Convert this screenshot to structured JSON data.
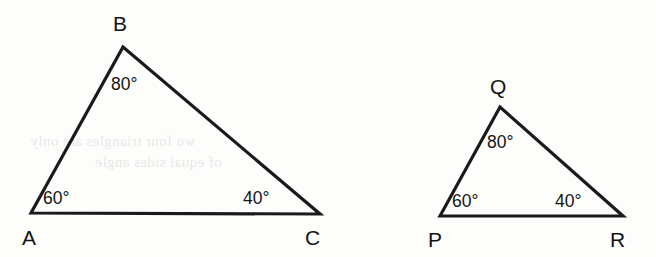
{
  "figure": {
    "background_color": "#fdfdfc",
    "stroke_color": "#1a1a1a",
    "triangles": [
      {
        "id": "triangle-abc",
        "name": "Triangle ABC",
        "vertices": [
          {
            "label": "A",
            "x": 31,
            "y": 213,
            "label_x": 22,
            "label_y": 245
          },
          {
            "label": "B",
            "x": 123,
            "y": 47,
            "label_x": 113,
            "label_y": 31
          },
          {
            "label": "C",
            "x": 320,
            "y": 214,
            "label_x": 305,
            "label_y": 245
          }
        ],
        "angles": [
          {
            "at": "A",
            "value": "60°",
            "x": 43,
            "y": 204
          },
          {
            "at": "B",
            "value": "80°",
            "x": 111,
            "y": 90
          },
          {
            "at": "C",
            "value": "40°",
            "x": 243,
            "y": 204
          }
        ]
      },
      {
        "id": "triangle-pqr",
        "name": "Triangle PQR",
        "vertices": [
          {
            "label": "P",
            "x": 440,
            "y": 216,
            "label_x": 428,
            "label_y": 247
          },
          {
            "label": "Q",
            "x": 500,
            "y": 107,
            "label_x": 490,
            "label_y": 94
          },
          {
            "label": "R",
            "x": 623,
            "y": 216,
            "label_x": 610,
            "label_y": 247
          }
        ],
        "angles": [
          {
            "at": "P",
            "value": "60°",
            "x": 452,
            "y": 207
          },
          {
            "at": "Q",
            "value": "80°",
            "x": 487,
            "y": 148
          },
          {
            "at": "R",
            "value": "40°",
            "x": 555,
            "y": 207
          }
        ]
      }
    ],
    "ghost_show_through": {
      "line1": "wo four triangles are only",
      "line2": "of equal sides angle"
    }
  }
}
